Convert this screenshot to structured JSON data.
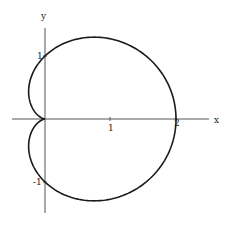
{
  "chart_data": {
    "type": "line",
    "title": "",
    "equation": "r = 1 + cos(theta)",
    "xlabel": "x",
    "ylabel": "y",
    "x_ticks": [
      {
        "value": 1,
        "label": "1"
      },
      {
        "value": 2,
        "label": "2"
      }
    ],
    "y_ticks": [
      {
        "value": 1,
        "label": "1"
      },
      {
        "value": -1,
        "label": "-1"
      }
    ],
    "xlim": [
      -0.5,
      2.5
    ],
    "ylim": [
      -1.5,
      1.6
    ],
    "grid": false,
    "legend": null,
    "series": [
      {
        "name": "cardioid",
        "color": "#1a1a1a",
        "points": [
          [
            2.0,
            0.0
          ],
          [
            1.9,
            0.68
          ],
          [
            1.65,
            1.14
          ],
          [
            1.25,
            1.3
          ],
          [
            0.75,
            1.3
          ],
          [
            0.3,
            1.12
          ],
          [
            0.0,
            1.0
          ],
          [
            -0.18,
            0.75
          ],
          [
            -0.25,
            0.43
          ],
          [
            -0.14,
            0.14
          ],
          [
            0.0,
            0.0
          ],
          [
            -0.14,
            -0.14
          ],
          [
            -0.25,
            -0.43
          ],
          [
            -0.18,
            -0.75
          ],
          [
            0.0,
            -1.0
          ],
          [
            0.3,
            -1.12
          ],
          [
            0.75,
            -1.3
          ],
          [
            1.25,
            -1.3
          ],
          [
            1.65,
            -1.14
          ],
          [
            1.9,
            -0.68
          ],
          [
            2.0,
            0.0
          ]
        ]
      }
    ],
    "axes_style": {
      "axis_color": "#555555",
      "curve_color": "#1a1a1a",
      "background": "#ffffff"
    }
  }
}
